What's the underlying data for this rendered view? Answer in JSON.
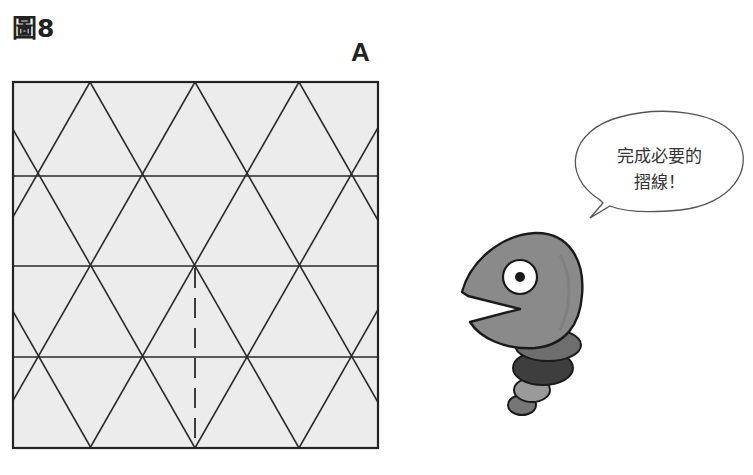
{
  "figure": {
    "label": "圖8",
    "panel_letter": "A"
  },
  "diagram": {
    "type": "origami-crease-pattern",
    "paper_color": "#ececec",
    "line_color": "#2a2a2a",
    "square": {
      "x": 13,
      "y": 82,
      "size": 365
    },
    "horizontal_crease_rows": 4,
    "triangle_apexes_top_x": [
      90,
      195,
      299
    ],
    "dashed_crease": {
      "x": 195,
      "from_y": 266,
      "to_y": 448,
      "style": "valley-fold"
    }
  },
  "speech_bubble": {
    "line1": "完成必要的",
    "line2": "摺線！"
  },
  "character": {
    "description": "gray worm-like mascot with open beak, segmented body",
    "body_color": "#8a8a8a",
    "segment_colors": [
      "#6e6e6e",
      "#3e3e3e",
      "#9a9a9a",
      "#767676"
    ]
  }
}
